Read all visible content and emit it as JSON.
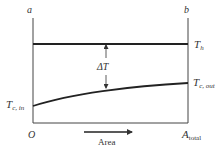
{
  "diagram": {
    "type": "heat-exchanger-temperature-profile",
    "labels": {
      "left_end": "a",
      "right_end": "b",
      "hot_temp": "T",
      "hot_temp_sub": "h",
      "delta_t": "ΔT",
      "cold_in": "T",
      "cold_in_sub": "c, in",
      "cold_out": "T",
      "cold_out_sub": "c, out",
      "origin": "O",
      "area_end": "A",
      "area_end_sub": "total",
      "x_axis": "Area"
    },
    "colors": {
      "line": "#333333",
      "background": "#ffffff"
    }
  }
}
